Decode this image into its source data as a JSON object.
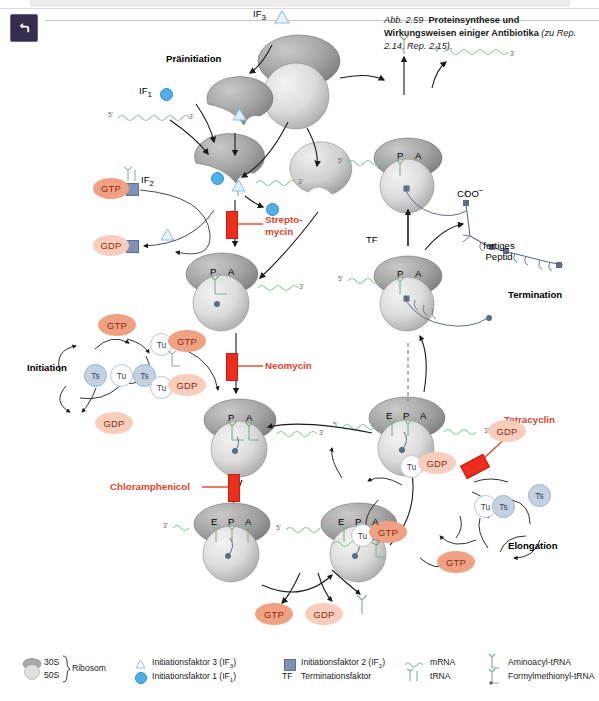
{
  "window": {
    "back_button_icon": "rotate-back-icon"
  },
  "caption": {
    "figure_number": "Abb. 2.59",
    "title": "Proteinsynthese und Wirkungsweisen einiger Antibiotika",
    "reference": "(zu Rep. 2.14, Rep. 2.15)."
  },
  "phases": {
    "preinitiation": "Präinitiation",
    "initiation": "Initiation",
    "elongation": "Elongation",
    "termination": "Termination"
  },
  "antibiotics": [
    {
      "name": "Streptomycin",
      "line1": "Strepto-",
      "line2": "mycin"
    },
    {
      "name": "Neomycin",
      "line1": "Neomycin",
      "line2": ""
    },
    {
      "name": "Chloramphenicol",
      "line1": "Chloramphenicol",
      "line2": ""
    },
    {
      "name": "Tetracyclin",
      "line1": "Tetracyclin",
      "line2": ""
    }
  ],
  "factors": {
    "if1": "IF",
    "if1_sub": "1",
    "if2": "IF",
    "if2_sub": "2",
    "if3": "IF",
    "if3_sub": "3",
    "tf": "TF"
  },
  "nucleotides": {
    "gtp": "GTP",
    "gdp": "GDP"
  },
  "elongation_factors": {
    "tu": "Tu",
    "ts": "Ts"
  },
  "ribosome_sites": {
    "e": "E",
    "p": "P",
    "a": "A"
  },
  "rna_ends": {
    "five_prime": "5'",
    "three_prime": "3'"
  },
  "peptide": {
    "terminus": "COO",
    "terminus_charge": "−",
    "label_line1": "fertiges",
    "label_line2": "Peptid"
  },
  "legend": {
    "ribosome": {
      "subunit_small": "30S",
      "subunit_large": "50S",
      "label": "Ribosom"
    },
    "items": [
      {
        "icon": "triangle-icon",
        "text": "Initiationsfaktor 3 (IF",
        "sub": "3",
        "tail": ")"
      },
      {
        "icon": "blue-circle-icon",
        "text": "Initiationsfaktor 1 (IF",
        "sub": "1",
        "tail": ")"
      },
      {
        "icon": "blue-square-icon",
        "text": "Initiationsfaktor 2 (IF",
        "sub": "2",
        "tail": ")"
      },
      {
        "icon": "tf-text-icon",
        "text": "Terminationsfaktor",
        "sub": "",
        "tail": ""
      },
      {
        "icon": "wave-icon",
        "text": "mRNA",
        "sub": "",
        "tail": ""
      },
      {
        "icon": "trna-icon",
        "text": "tRNA",
        "sub": "",
        "tail": ""
      },
      {
        "icon": "aminoacyl-trna-icon",
        "text": "Aminoacyl-tRNA",
        "sub": "",
        "tail": ""
      },
      {
        "icon": "fmet-trna-icon",
        "text": "Formylmethionyl-tRNA",
        "sub": "",
        "tail": ""
      }
    ],
    "tf_abbrev": "TF"
  },
  "colors": {
    "drug_red": "#e2442c",
    "drug_bar": "#ed2d1e",
    "gtp_fill": "#f0a183",
    "gdp_fill": "#f8cdbb",
    "nucleotide_text": "#8a2a12",
    "ts_fill": "#c3d2e2",
    "tu_fill": "#fbfcfd",
    "if1_blue": "#4db0e8",
    "if2_blue": "#7f92b5",
    "mrna_green": "#8cc09a",
    "trna_green": "#7fae8c",
    "ribosome_gray_dark": "#8d8d8d",
    "ribosome_gray_light": "#d2d2d2",
    "titlebar_navy": "#352c4e"
  }
}
